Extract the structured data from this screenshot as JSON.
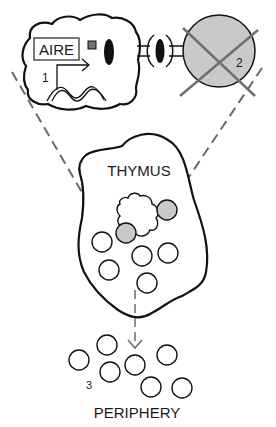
{
  "diagram": {
    "labels": {
      "aire": "AIRE",
      "cell1_number": "1",
      "cell2_number": "2",
      "periphery_number": "3",
      "thymus": "THYMUS",
      "periphery": "PERIPHERY"
    },
    "colors": {
      "stroke": "#111111",
      "grey_cell": "#c9c9c9",
      "grey_square": "#707070",
      "dashed_line": "#6a6a6a",
      "cross": "#707070",
      "background": "#ffffff"
    }
  }
}
